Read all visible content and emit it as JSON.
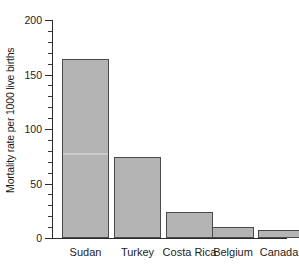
{
  "chart_data": {
    "type": "bar",
    "title": "",
    "xlabel": "",
    "ylabel": "Mortality rate per 1000 live births",
    "categories": [
      "Sudan",
      "Turkey",
      "Costa Rica",
      "Belgium",
      "Canada"
    ],
    "values": [
      164,
      74,
      24,
      10,
      7
    ],
    "ylim": [
      0,
      200
    ],
    "yticks": [
      0,
      50,
      100,
      150,
      200
    ],
    "ytick_labels": [
      "0",
      "50",
      "100",
      "150",
      "200"
    ],
    "yminor_step": 10,
    "grid": false,
    "legend": null,
    "bar_fill_color": "#b4b4b4",
    "bar_edge_color": "#4a4a4a",
    "axis_color": "#2b2b2b",
    "background_color": "#ffffff"
  },
  "axis": {
    "y_title": "Mortality rate per 1000 live births",
    "ticks": [
      {
        "label": "200",
        "value": 200
      },
      {
        "label": "150",
        "value": 150
      },
      {
        "label": "100",
        "value": 100
      },
      {
        "label": "50",
        "value": 50
      },
      {
        "label": "0",
        "value": 0
      }
    ]
  },
  "bars": [
    {
      "label": "Sudan",
      "value": 164,
      "left": 62,
      "width": 47
    },
    {
      "label": "Turkey",
      "value": 74,
      "left": 114,
      "width": 47
    },
    {
      "label": "Costa Rica",
      "value": 24,
      "left": 166,
      "width": 47
    },
    {
      "label": "Belgium",
      "value": 10,
      "left": 212,
      "width": 42
    },
    {
      "label": "Canada",
      "value": 7,
      "left": 258,
      "width": 42
    }
  ]
}
